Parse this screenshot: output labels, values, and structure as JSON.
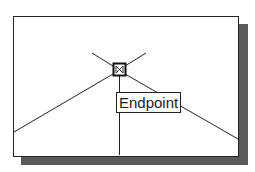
{
  "osnap": {
    "tooltip_label": "Endpoint",
    "marker_icon": "endpoint-snap-marker-icon"
  },
  "colors": {
    "line": "#222222",
    "shadow": "#5a5a5a",
    "background": "#ffffff"
  }
}
